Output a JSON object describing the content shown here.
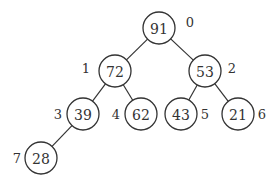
{
  "diagram": {
    "type": "binary-heap-tree",
    "nodes": [
      {
        "index": "0",
        "value": "91",
        "cx": 159,
        "cy": 28,
        "lx": 190,
        "ly": 22
      },
      {
        "index": "1",
        "value": "72",
        "cx": 115,
        "cy": 71,
        "lx": 86,
        "ly": 68
      },
      {
        "index": "2",
        "value": "53",
        "cx": 205,
        "cy": 71,
        "lx": 232,
        "ly": 68
      },
      {
        "index": "3",
        "value": "39",
        "cx": 83,
        "cy": 114,
        "lx": 58,
        "ly": 114
      },
      {
        "index": "4",
        "value": "62",
        "cx": 141,
        "cy": 114,
        "lx": 116,
        "ly": 114
      },
      {
        "index": "5",
        "value": "43",
        "cx": 181,
        "cy": 114,
        "lx": 205,
        "ly": 114
      },
      {
        "index": "6",
        "value": "21",
        "cx": 238,
        "cy": 114,
        "lx": 262,
        "ly": 114
      },
      {
        "index": "7",
        "value": "28",
        "cx": 41,
        "cy": 158,
        "lx": 17,
        "ly": 158
      }
    ],
    "edges": [
      [
        0,
        1
      ],
      [
        0,
        2
      ],
      [
        1,
        3
      ],
      [
        1,
        4
      ],
      [
        2,
        5
      ],
      [
        2,
        6
      ],
      [
        3,
        7
      ]
    ],
    "radius": 16,
    "colors": {
      "stroke": "#333333",
      "fill": "#ffffff",
      "text": "#333333"
    }
  }
}
